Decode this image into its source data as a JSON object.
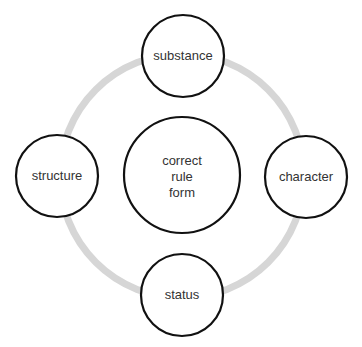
{
  "diagram": {
    "type": "cycle-with-center",
    "colors": {
      "ring": "#d6d6d6",
      "node_stroke": "#111111",
      "node_fill": "#ffffff",
      "text": "#333333"
    },
    "center": {
      "lines": [
        "correct",
        "rule",
        "form"
      ]
    },
    "nodes": [
      {
        "position": "top",
        "label": "substance"
      },
      {
        "position": "right",
        "label": "character"
      },
      {
        "position": "bottom",
        "label": "status"
      },
      {
        "position": "left",
        "label": "structure"
      }
    ]
  }
}
